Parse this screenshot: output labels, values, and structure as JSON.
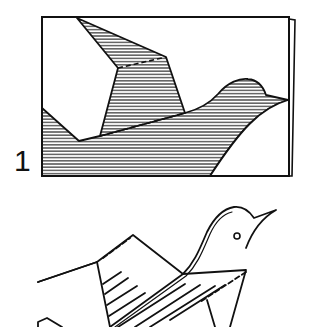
{
  "diagram": {
    "type": "origami-instructions",
    "steps": [
      {
        "number": "1",
        "description": "Folded paper rectangle showing a bird silhouette with hatched regions and dashed fold lines"
      },
      {
        "number": "",
        "description": "Resulting 3D bird figure with wings, head with eye and open beak, hatched wing surfaces and dashed fold lines"
      }
    ]
  },
  "colors": {
    "ink": "#111111",
    "paper": "#ffffff"
  }
}
